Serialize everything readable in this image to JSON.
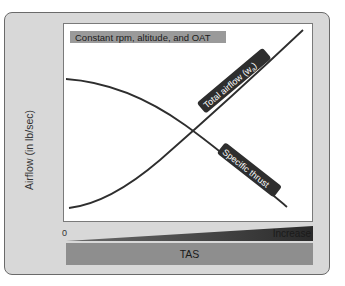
{
  "figure": {
    "condition_label": "Constant rpm, altitude, and OAT",
    "y_axis_label": "Airflow (in lb/sec)",
    "x_axis_origin": "0",
    "x_axis_ramp_label": "Increase",
    "x_axis_label": "TAS",
    "curves": [
      {
        "name": "Total airflow (wa)",
        "label": "Total airflow (w",
        "subscript": "a",
        "label_suffix": ")",
        "trend": "increasing"
      },
      {
        "name": "Specific thrust",
        "label": "Specific thrust",
        "trend": "decreasing"
      }
    ],
    "colors": {
      "panel_bg": "#d8d8d8",
      "panel_border": "#6a6a6a",
      "plot_bg": "#ffffff",
      "curve": "#2e2e2e",
      "label_box": "#9a9a9a",
      "tag_bg": "#2e2e2e",
      "tas_bar": "#8e8e8e"
    }
  }
}
